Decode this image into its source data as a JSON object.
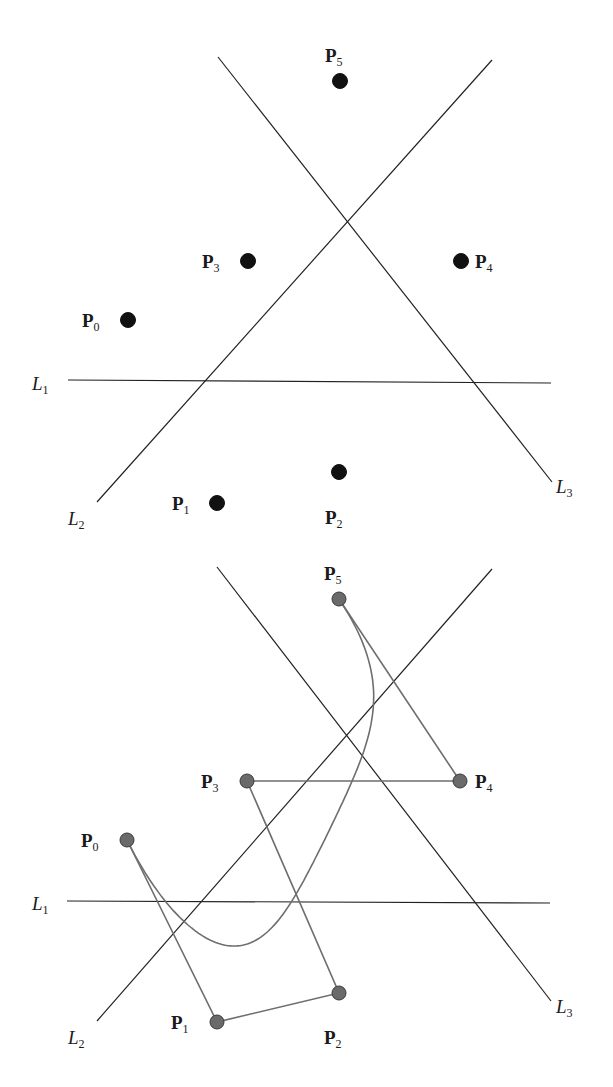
{
  "colors": {
    "line": "#222222",
    "polygon": "#6e6e6e",
    "curve": "#6e6e6e",
    "point_top": "#111111",
    "point_bottom": "#6a6a6a",
    "point_bottom_stroke": "#3a3a3a",
    "label": "#1a1a1a"
  },
  "chart_data": [
    {
      "type": "scatter",
      "title": "",
      "panel": "top",
      "points": [
        {
          "name": "P",
          "sub": "0",
          "x": 128,
          "y": 320,
          "label_x": 82,
          "label_y": 327
        },
        {
          "name": "P",
          "sub": "1",
          "x": 217,
          "y": 503,
          "label_x": 172,
          "label_y": 510
        },
        {
          "name": "P",
          "sub": "2",
          "x": 339,
          "y": 472,
          "label_x": 325,
          "label_y": 524
        },
        {
          "name": "P",
          "sub": "3",
          "x": 248,
          "y": 261,
          "label_x": 202,
          "label_y": 268
        },
        {
          "name": "P",
          "sub": "4",
          "x": 461,
          "y": 261,
          "label_x": 475,
          "label_y": 268
        },
        {
          "name": "P",
          "sub": "5",
          "x": 340,
          "y": 81,
          "label_x": 325,
          "label_y": 62
        }
      ],
      "lines": [
        {
          "name": "L",
          "sub": "1",
          "x1": 68,
          "y1": 380,
          "x2": 551,
          "y2": 383,
          "label_x": 32,
          "label_y": 390
        },
        {
          "name": "L",
          "sub": "2",
          "x1": 492,
          "y1": 60,
          "x2": 97,
          "y2": 502,
          "label_x": 68,
          "label_y": 525
        },
        {
          "name": "L",
          "sub": "3",
          "x1": 218,
          "y1": 57,
          "x2": 552,
          "y2": 482,
          "label_x": 556,
          "label_y": 493
        }
      ]
    },
    {
      "type": "scatter",
      "title": "",
      "panel": "bottom",
      "bezier_degree": 5,
      "points": [
        {
          "name": "P",
          "sub": "0",
          "x": 127,
          "y": 840,
          "label_x": 81,
          "label_y": 847
        },
        {
          "name": "P",
          "sub": "1",
          "x": 217,
          "y": 1022,
          "label_x": 171,
          "label_y": 1029
        },
        {
          "name": "P",
          "sub": "2",
          "x": 339,
          "y": 993,
          "label_x": 324,
          "label_y": 1044
        },
        {
          "name": "P",
          "sub": "3",
          "x": 247,
          "y": 781,
          "label_x": 201,
          "label_y": 788
        },
        {
          "name": "P",
          "sub": "4",
          "x": 460,
          "y": 781,
          "label_x": 475,
          "label_y": 788
        },
        {
          "name": "P",
          "sub": "5",
          "x": 339,
          "y": 599,
          "label_x": 324,
          "label_y": 580
        }
      ],
      "polygon_order": [
        0,
        1,
        2,
        3,
        4,
        5
      ],
      "lines": [
        {
          "name": "L",
          "sub": "1",
          "x1": 67,
          "y1": 901,
          "x2": 550,
          "y2": 903,
          "label_x": 32,
          "label_y": 910
        },
        {
          "name": "L",
          "sub": "2",
          "x1": 492,
          "y1": 569,
          "x2": 97,
          "y2": 1021,
          "label_x": 68,
          "label_y": 1044
        },
        {
          "name": "L",
          "sub": "3",
          "x1": 217,
          "y1": 567,
          "x2": 551,
          "y2": 1001,
          "label_x": 556,
          "label_y": 1013
        }
      ]
    }
  ]
}
